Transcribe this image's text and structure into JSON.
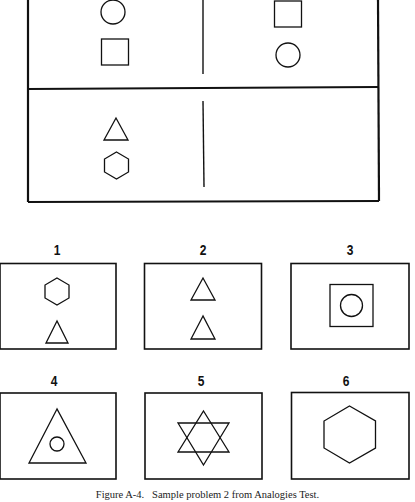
{
  "figure": {
    "caption": "Figure A-4.   Sample problem 2 from Analogies Test.",
    "stroke_color": "#111111",
    "background": "#ffffff"
  },
  "problem": {
    "row1": {
      "left": [
        "circle",
        "square"
      ],
      "right": [
        "square",
        "circle"
      ]
    },
    "row2": {
      "left": [
        "triangle",
        "hexagon"
      ],
      "right": []
    }
  },
  "options": [
    {
      "label": "1",
      "content": [
        "hexagon",
        "triangle"
      ]
    },
    {
      "label": "2",
      "content": [
        "triangle",
        "triangle"
      ]
    },
    {
      "label": "3",
      "content": [
        "square-with-circle-inside"
      ]
    },
    {
      "label": "4",
      "content": [
        "triangle-with-circle-inside"
      ]
    },
    {
      "label": "5",
      "content": [
        "six-pointed-star"
      ]
    },
    {
      "label": "6",
      "content": [
        "hexagon"
      ]
    }
  ]
}
